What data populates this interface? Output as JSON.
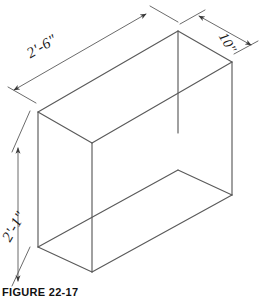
{
  "figure": {
    "caption": "FIGURE 22-17",
    "object_type": "isometric-rectangular-box",
    "line_color": "#5a5a5a",
    "text_color": "#1a1a1a",
    "background": "#ffffff"
  },
  "dimensions": {
    "width": {
      "label": "2'-6\"",
      "axis": "horizontal-left",
      "arrow_style": "double-arrow"
    },
    "height": {
      "label": "2'-1\"",
      "axis": "vertical",
      "arrow_style": "double-arrow"
    },
    "depth": {
      "label": "10\"",
      "axis": "horizontal-right",
      "arrow_style": "double-arrow"
    }
  }
}
